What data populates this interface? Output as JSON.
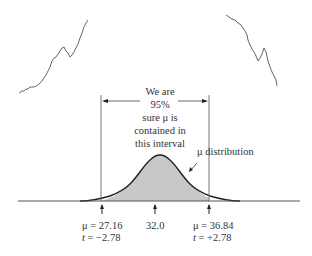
{
  "diagram": {
    "interval_text": [
      "We are",
      "95%",
      "sure μ is",
      "contained in",
      "this interval"
    ],
    "curve_label": "μ distribution",
    "markers": [
      {
        "line1": "μ = 27.16",
        "t_symbol": "t",
        "t_value": " = −2.78"
      },
      {
        "line1": "32.0"
      },
      {
        "line1": "μ = 36.84",
        "t_symbol": "t",
        "t_value": " = +2.78"
      }
    ],
    "colors": {
      "fill": "#c8c8c8",
      "stroke": "#222222",
      "line": "#555555"
    }
  }
}
